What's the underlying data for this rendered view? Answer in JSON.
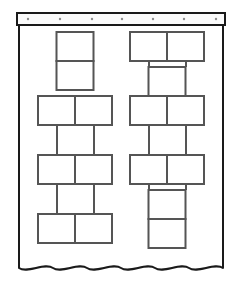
{
  "diagram": {
    "type": "line-drawing",
    "colors": {
      "stroke": "#1a1a1a",
      "box_stroke": "#555555",
      "fill": "#ffffff",
      "grommet": "#8c8c8c",
      "header_fill": "#fbfbfb"
    },
    "canvas": {
      "width": 241,
      "height": 286
    }
  },
  "header": {
    "label": "curtain-header-bar",
    "x": 17,
    "y": 13,
    "width": 208,
    "height": 12,
    "grommet_count": 7,
    "grommet_radius": 1.2,
    "grommets": [
      {
        "label": "grommet-1",
        "cx": 28,
        "cy": 19
      },
      {
        "label": "grommet-2",
        "cx": 60,
        "cy": 19
      },
      {
        "label": "grommet-3",
        "cx": 92,
        "cy": 19
      },
      {
        "label": "grommet-4",
        "cx": 122,
        "cy": 19
      },
      {
        "label": "grommet-5",
        "cx": 153,
        "cy": 19
      },
      {
        "label": "grommet-6",
        "cx": 184,
        "cy": 19
      },
      {
        "label": "grommet-7",
        "cx": 216,
        "cy": 19
      }
    ]
  },
  "panel": {
    "label": "curtain-body",
    "left_edge_x": 19,
    "right_edge_x": 223,
    "top_y": 25,
    "hem_top_y": 262,
    "wave": {
      "label": "wavy-hem",
      "baseline_y": 268,
      "amplitude": 6,
      "wave_count": 6,
      "start_x": 19,
      "end_x": 223
    }
  },
  "columns": [
    {
      "label": "left-column",
      "center_x": 75,
      "box_width": 37,
      "box_height": 29,
      "rows": [
        {
          "label": "left-row-1",
          "kind": "single",
          "y": 32,
          "cells": 1
        },
        {
          "label": "left-row-2",
          "kind": "single",
          "y": 61,
          "cells": 1
        },
        {
          "label": "left-row-3",
          "kind": "double",
          "y": 96,
          "cells": 2
        },
        {
          "label": "left-row-4",
          "kind": "double",
          "y": 155,
          "cells": 2
        },
        {
          "label": "left-row-5",
          "kind": "double",
          "y": 214,
          "cells": 2
        }
      ],
      "connectors": [
        {
          "label": "left-connector-a",
          "x": 57,
          "y1": 125,
          "y2": 155
        },
        {
          "label": "left-connector-b",
          "x": 94,
          "y1": 125,
          "y2": 155
        },
        {
          "label": "left-connector-c",
          "x": 57,
          "y1": 184,
          "y2": 214
        },
        {
          "label": "left-connector-d",
          "x": 94,
          "y1": 184,
          "y2": 214
        }
      ]
    },
    {
      "label": "right-column",
      "center_x": 167,
      "box_width": 37,
      "box_height": 29,
      "rows": [
        {
          "label": "right-row-1",
          "kind": "double",
          "y": 32,
          "cells": 2
        },
        {
          "label": "right-row-2",
          "kind": "single",
          "y": 67,
          "cells": 1
        },
        {
          "label": "right-row-3",
          "kind": "double",
          "y": 96,
          "cells": 2
        },
        {
          "label": "right-row-4",
          "kind": "double",
          "y": 155,
          "cells": 2
        },
        {
          "label": "right-row-5",
          "kind": "single",
          "y": 190,
          "cells": 1
        },
        {
          "label": "right-row-6",
          "kind": "single",
          "y": 219,
          "cells": 1
        }
      ],
      "connectors": [
        {
          "label": "right-connector-a",
          "x": 149,
          "y1": 61,
          "y2": 67
        },
        {
          "label": "right-connector-b",
          "x": 186,
          "y1": 61,
          "y2": 67
        },
        {
          "label": "right-connector-c",
          "x": 149,
          "y1": 125,
          "y2": 155
        },
        {
          "label": "right-connector-d",
          "x": 186,
          "y1": 125,
          "y2": 155
        },
        {
          "label": "right-connector-e",
          "x": 149,
          "y1": 184,
          "y2": 190
        },
        {
          "label": "right-connector-f",
          "x": 186,
          "y1": 184,
          "y2": 190
        }
      ]
    }
  ]
}
